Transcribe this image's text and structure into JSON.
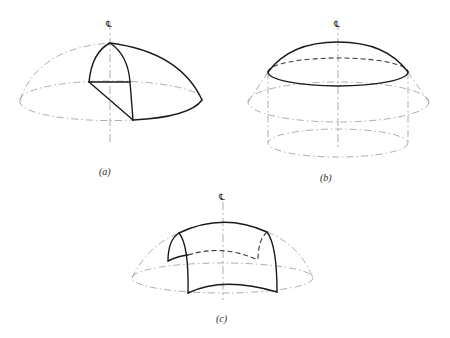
{
  "figure": {
    "panels": [
      {
        "id": "a",
        "label": "(a)",
        "centerline_symbol": "℄",
        "description": "Hemispherical dome with one quarter segment highlighted"
      },
      {
        "id": "b",
        "label": "(b)",
        "centerline_symbol": "℄",
        "description": "Spherical cap cut off above a cylinder within dome"
      },
      {
        "id": "c",
        "label": "(c)",
        "centerline_symbol": "℄",
        "description": "Curved shell segment cut from dome"
      }
    ]
  }
}
